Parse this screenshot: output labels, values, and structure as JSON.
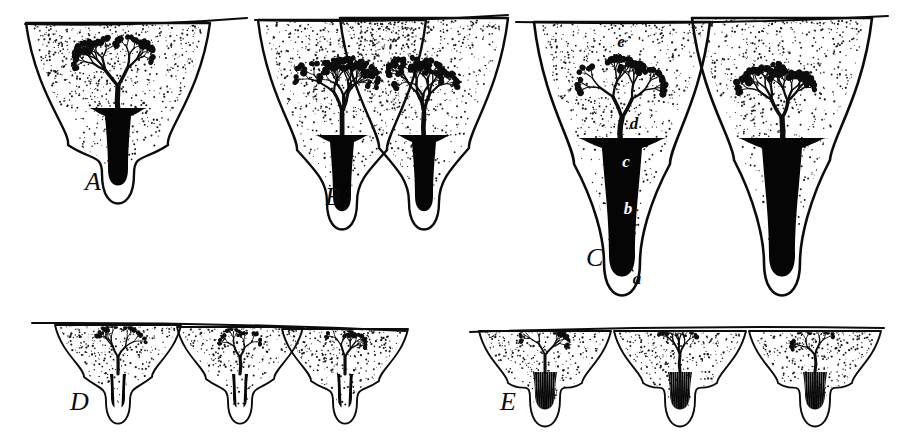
{
  "figure": {
    "background_color": "#ffffff",
    "ink_color": "#0b0b0b",
    "width": 904,
    "height": 446,
    "panel_count": 5
  },
  "panels": [
    {
      "id": "A",
      "letter": "A",
      "letter_x": 85,
      "letter_y": 190,
      "description": "single lobe with one unbranched solid duct",
      "lobe_count": 1,
      "duct_style": "solid",
      "duct_count": 1
    },
    {
      "id": "B",
      "letter": "B",
      "letter_x": 325,
      "letter_y": 205,
      "description": "two lobes converging on a shared solid duct",
      "lobe_count": 2,
      "duct_style": "solid",
      "duct_count": 2
    },
    {
      "id": "C",
      "letter": "C",
      "letter_x": 586,
      "letter_y": 266,
      "description": "two deep lobes, each with its own solid duct, labelled a-e",
      "lobe_count": 2,
      "duct_style": "solid",
      "duct_count": 2
    },
    {
      "id": "D",
      "letter": "D",
      "letter_x": 70,
      "letter_y": 410,
      "description": "three shallow lobes, each duct split into two black bars",
      "lobe_count": 3,
      "duct_style": "bars",
      "duct_count": 2
    },
    {
      "id": "E",
      "letter": "E",
      "letter_x": 500,
      "letter_y": 410,
      "description": "three shallow lobes, each duct finely striated",
      "lobe_count": 3,
      "duct_style": "striated",
      "duct_count": 11
    }
  ],
  "part_labels": [
    {
      "key": "a",
      "text": "a",
      "x": 637,
      "y": 284,
      "on_dark": false,
      "meaning": "duct orifice at surface"
    },
    {
      "key": "b",
      "text": "b",
      "x": 628,
      "y": 214,
      "on_dark": true,
      "meaning": "excretory duct"
    },
    {
      "key": "c",
      "text": "c",
      "x": 626,
      "y": 167,
      "on_dark": true,
      "meaning": "duct neck / collecting region"
    },
    {
      "key": "d",
      "text": "d",
      "x": 634,
      "y": 129,
      "on_dark": false,
      "meaning": "branching intralobular ducts"
    },
    {
      "key": "e",
      "text": "e",
      "x": 621,
      "y": 47,
      "on_dark": false,
      "meaning": "stippled mesenchyme / stroma"
    }
  ],
  "legend_note": "Letters A–E mark successive stages; letters a–e mark regions of the gland in stage C.",
  "colors": {
    "ink": "#0b0b0b",
    "duct_fill": "#050505",
    "stipple": "#1a1a1a",
    "paper": "#ffffff",
    "reversed_label": "#ffffff"
  }
}
